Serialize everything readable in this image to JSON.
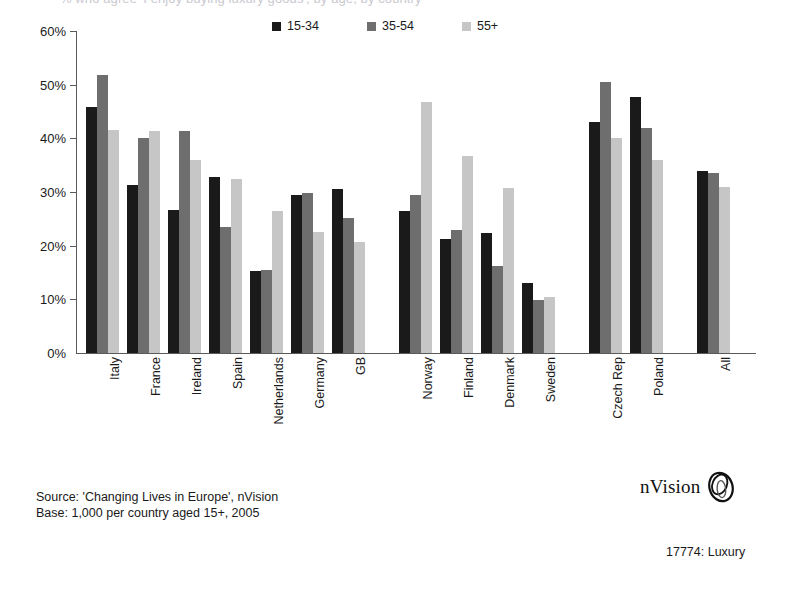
{
  "title": {
    "text": "% who agree 'I enjoy buying luxury goods', by age, by country"
  },
  "legend": {
    "items": [
      {
        "label": "15-34",
        "color": "#1a1a1a"
      },
      {
        "label": "35-54",
        "color": "#6e6e6e"
      },
      {
        "label": "55+",
        "color": "#c6c6c6"
      }
    ]
  },
  "axis": {
    "y_ticks": [
      "0%",
      "10%",
      "20%",
      "30%",
      "40%",
      "50%",
      "60%"
    ]
  },
  "source": {
    "line1": "Source: 'Changing Lives in Europe', nVision",
    "line2": "Base: 1,000 per country aged 15+, 2005"
  },
  "brand": {
    "name": "nVision",
    "mark": "nvision-ellipse-logo"
  },
  "footer": {
    "ref": "17774: Luxury"
  },
  "chart_data": {
    "type": "bar",
    "title": "% who agree 'I enjoy buying luxury goods', by age, by country",
    "xlabel": "",
    "ylabel": "",
    "ylim": [
      0,
      60
    ],
    "ytick_step": 10,
    "ytick_format": "percent",
    "grid": false,
    "legend_position": "top-center",
    "categories": [
      "Italy",
      "France",
      "Ireland",
      "Spain",
      "Netherlands",
      "Germany",
      "GB",
      "Norway",
      "Finland",
      "Denmark",
      "Sweden",
      "Czech Rep",
      "Poland",
      "All"
    ],
    "group_breaks_after": [
      "GB",
      "Sweden",
      "Poland"
    ],
    "series": [
      {
        "name": "15-34",
        "color": "#1a1a1a",
        "values": [
          45.9,
          31.4,
          26.6,
          32.8,
          15.2,
          29.5,
          30.5,
          26.5,
          21.3,
          22.3,
          13.0,
          43.0,
          47.7,
          34.0
        ]
      },
      {
        "name": "35-54",
        "color": "#6e6e6e",
        "values": [
          51.8,
          40.0,
          41.3,
          23.5,
          15.5,
          29.8,
          25.2,
          29.5,
          23.0,
          16.2,
          9.8,
          50.5,
          42.0,
          33.6
        ]
      },
      {
        "name": "55+",
        "color": "#c6c6c6",
        "values": [
          41.6,
          41.3,
          36.0,
          32.4,
          26.5,
          22.5,
          20.7,
          46.7,
          36.7,
          30.8,
          10.5,
          40.0,
          36.0,
          31.0
        ]
      }
    ]
  }
}
